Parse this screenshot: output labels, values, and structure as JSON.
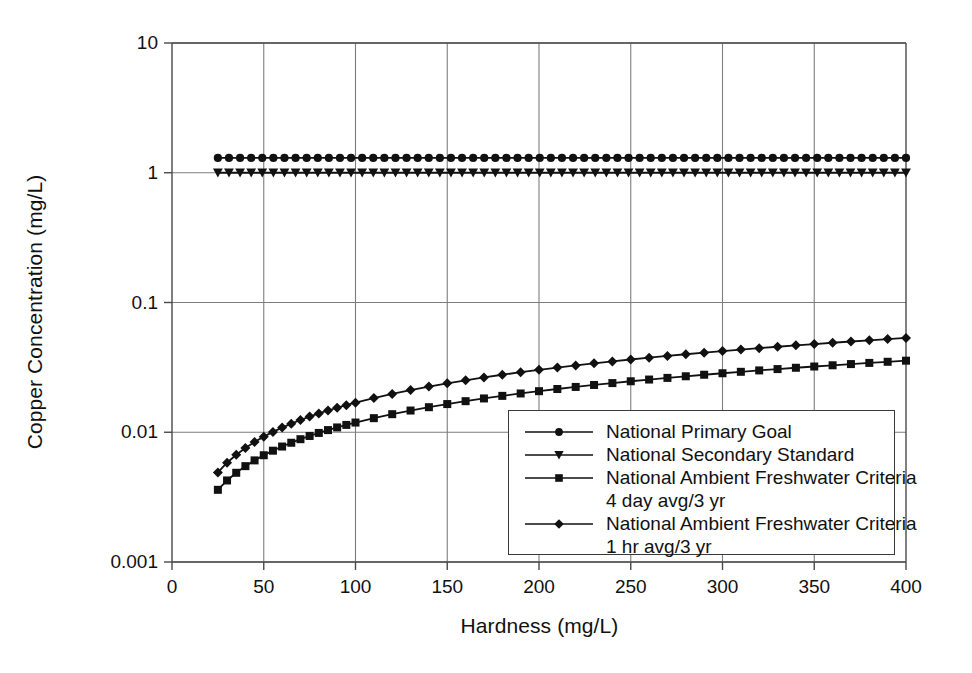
{
  "chart_data": {
    "type": "line",
    "title": "",
    "xlabel": "Hardness (mg/L)",
    "ylabel": "Copper Concentration (mg/L)",
    "yscale": "log",
    "xlim": [
      0,
      400
    ],
    "ylim": [
      0.001,
      10
    ],
    "grid": true,
    "legend_position": "lower right",
    "xticks": [
      0,
      50,
      100,
      150,
      200,
      250,
      300,
      350,
      400
    ],
    "xtick_labels": [
      "0",
      "50",
      "100",
      "150",
      "200",
      "250",
      "300",
      "350",
      "400"
    ],
    "yticks": [
      0.001,
      0.01,
      0.1,
      1,
      10
    ],
    "ytick_labels": [
      "0.001",
      "0.01",
      "0.1",
      "1",
      "10"
    ],
    "x": [
      25,
      30,
      35,
      40,
      45,
      50,
      55,
      60,
      65,
      70,
      75,
      80,
      85,
      90,
      95,
      100,
      110,
      120,
      130,
      140,
      150,
      160,
      170,
      180,
      190,
      200,
      210,
      220,
      230,
      240,
      250,
      260,
      270,
      280,
      290,
      300,
      310,
      320,
      330,
      340,
      350,
      360,
      370,
      380,
      390,
      400
    ],
    "series": [
      {
        "name": "National Primary Goal",
        "marker": "circle",
        "color": "#111111",
        "constant": true,
        "value": 1.3,
        "values": [
          1.3,
          1.3,
          1.3,
          1.3,
          1.3,
          1.3,
          1.3,
          1.3,
          1.3,
          1.3,
          1.3,
          1.3,
          1.3,
          1.3,
          1.3,
          1.3,
          1.3,
          1.3,
          1.3,
          1.3,
          1.3,
          1.3,
          1.3,
          1.3,
          1.3,
          1.3,
          1.3,
          1.3,
          1.3,
          1.3,
          1.3,
          1.3,
          1.3,
          1.3,
          1.3,
          1.3,
          1.3,
          1.3,
          1.3,
          1.3,
          1.3,
          1.3,
          1.3,
          1.3,
          1.3,
          1.3
        ]
      },
      {
        "name": "National Secondary Standard",
        "marker": "triangle-down",
        "color": "#111111",
        "constant": true,
        "value": 1.0,
        "values": [
          1.0,
          1.0,
          1.0,
          1.0,
          1.0,
          1.0,
          1.0,
          1.0,
          1.0,
          1.0,
          1.0,
          1.0,
          1.0,
          1.0,
          1.0,
          1.0,
          1.0,
          1.0,
          1.0,
          1.0,
          1.0,
          1.0,
          1.0,
          1.0,
          1.0,
          1.0,
          1.0,
          1.0,
          1.0,
          1.0,
          1.0,
          1.0,
          1.0,
          1.0,
          1.0,
          1.0,
          1.0,
          1.0,
          1.0,
          1.0,
          1.0,
          1.0,
          1.0,
          1.0,
          1.0,
          1.0
        ]
      },
      {
        "name": "National Ambient Freshwater Criteria 4 day avg/3 yr",
        "name_line1": "National Ambient Freshwater Criteria",
        "name_line2": "4 day avg/3 yr",
        "marker": "square",
        "color": "#111111",
        "constant": false,
        "values": [
          0.0036,
          0.00425,
          0.00487,
          0.00548,
          0.00607,
          0.00665,
          0.00721,
          0.00776,
          0.0083,
          0.00884,
          0.00936,
          0.00988,
          0.01039,
          0.01089,
          0.01139,
          0.01188,
          0.01284,
          0.01378,
          0.0147,
          0.0156,
          0.01649,
          0.01736,
          0.01822,
          0.01907,
          0.0199,
          0.02073,
          0.02154,
          0.02235,
          0.02314,
          0.02393,
          0.02471,
          0.02548,
          0.02624,
          0.027,
          0.02775,
          0.02849,
          0.02923,
          0.02996,
          0.03068,
          0.0314,
          0.03211,
          0.03282,
          0.03353,
          0.03423,
          0.03492,
          0.03561
        ]
      },
      {
        "name": "National Ambient Freshwater Criteria 1 hr avg/3 yr",
        "name_line1": "National Ambient Freshwater Criteria",
        "name_line2": "1 hr avg/3 yr",
        "marker": "diamond",
        "color": "#111111",
        "constant": false,
        "values": [
          0.0049,
          0.00582,
          0.00671,
          0.00757,
          0.00842,
          0.00925,
          0.01006,
          0.01086,
          0.01165,
          0.01243,
          0.0132,
          0.01396,
          0.01471,
          0.01545,
          0.01618,
          0.01691,
          0.01834,
          0.01975,
          0.02113,
          0.02249,
          0.02383,
          0.02515,
          0.02645,
          0.02774,
          0.02901,
          0.03026,
          0.03151,
          0.03274,
          0.03396,
          0.03517,
          0.03637,
          0.03755,
          0.03873,
          0.0399,
          0.04106,
          0.04221,
          0.04335,
          0.04449,
          0.04561,
          0.04673,
          0.04784,
          0.04895,
          0.05005,
          0.05114,
          0.05222,
          0.0533
        ]
      }
    ]
  },
  "axes": {
    "x_title": "Hardness (mg/L)",
    "y_title": "Copper Concentration (mg/L)"
  },
  "legend": {
    "entries": [
      {
        "label": "National Primary Goal",
        "marker": "circle"
      },
      {
        "label": "National Secondary Standard",
        "marker": "triangle-down"
      },
      {
        "label": "National Ambient Freshwater Criteria",
        "marker": "square"
      },
      {
        "label": "4 day avg/3 yr",
        "marker": "none"
      },
      {
        "label": "National Ambient Freshwater Criteria",
        "marker": "diamond"
      },
      {
        "label": "1 hr avg/3 yr",
        "marker": "none"
      }
    ]
  }
}
